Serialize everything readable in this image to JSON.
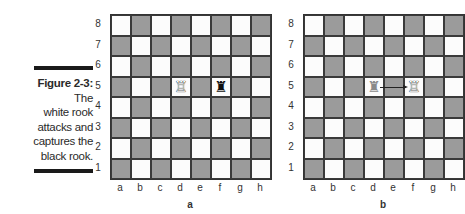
{
  "caption": {
    "figure": "Figure 2-3:",
    "text_lines": [
      "The",
      "white rook",
      "attacks and",
      "captures the",
      "black rook."
    ]
  },
  "files": [
    "a",
    "b",
    "c",
    "d",
    "e",
    "f",
    "g",
    "h"
  ],
  "ranks": [
    "8",
    "7",
    "6",
    "5",
    "4",
    "3",
    "2",
    "1"
  ],
  "boards": [
    {
      "label": "a",
      "pieces": [
        {
          "square": "d5",
          "piece": "white-rook",
          "glyph": "♖"
        },
        {
          "square": "f5",
          "piece": "black-rook",
          "glyph": "♜"
        }
      ]
    },
    {
      "label": "b",
      "pieces": [
        {
          "square": "d5",
          "piece": "ghost-rook",
          "glyph": "♜"
        },
        {
          "square": "f5",
          "piece": "white-rook",
          "glyph": "♖"
        }
      ],
      "arrow": {
        "from": "d5",
        "to": "f5"
      }
    }
  ],
  "colors": {
    "light_square": "#fcfcfc",
    "dark_square": "#9b9b9b",
    "caption_bar": "#1a1a1a"
  }
}
